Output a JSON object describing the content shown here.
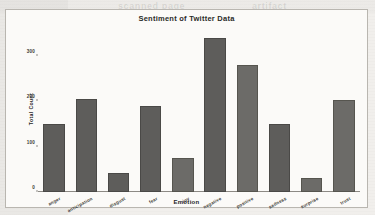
{
  "figure": {
    "title": "Sentiment of Twitter Data",
    "xlabel": "Emotion",
    "ylabel": "Total Count"
  },
  "chart_data": {
    "type": "bar",
    "title": "Sentiment of Twitter Data",
    "xlabel": "Emotion",
    "ylabel": "Total Count",
    "categories": [
      "anger",
      "anticipation",
      "disgust",
      "fear",
      "joy",
      "negative",
      "positive",
      "sadness",
      "surprise",
      "trust"
    ],
    "values": [
      150,
      205,
      42,
      190,
      75,
      340,
      280,
      150,
      32,
      203
    ],
    "ylim": [
      0,
      360
    ],
    "yticks": [
      0,
      100,
      200,
      300
    ],
    "ytick_labels": [
      "0",
      "100",
      "200",
      "300"
    ],
    "grid": false,
    "legend": null,
    "bar_color": "#5e5d5b",
    "background_color": "#fbfaf8"
  },
  "ghost_text": [
    {
      "t": "scanned page",
      "x": 120,
      "y": 2
    },
    {
      "t": "artifact",
      "x": 250,
      "y": 2
    },
    {
      "t": "residual ink",
      "x": 40,
      "y": 30
    },
    {
      "t": "show",
      "x": 230,
      "y": 60
    },
    {
      "t": "bleed",
      "x": 300,
      "y": 120
    }
  ]
}
